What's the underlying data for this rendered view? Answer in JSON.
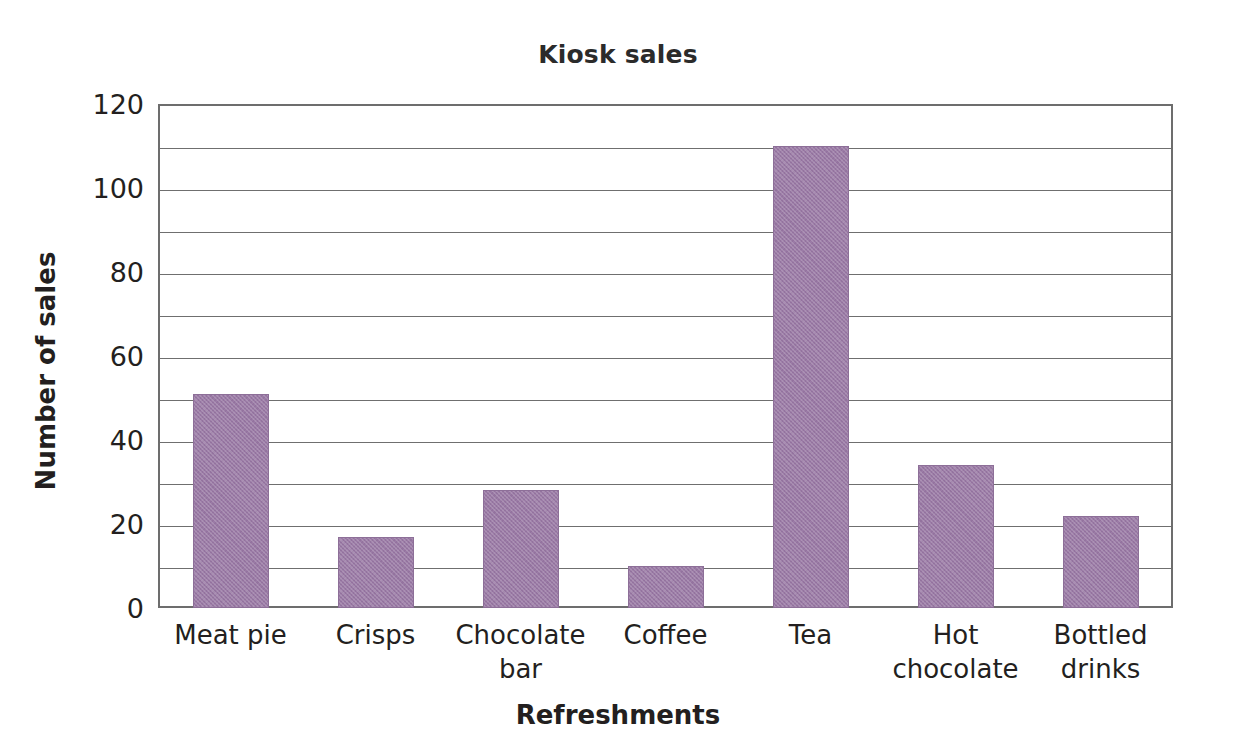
{
  "chart_data": {
    "type": "bar",
    "title": "Kiosk sales",
    "xlabel": "Refreshments",
    "ylabel": "Number of sales",
    "categories": [
      "Meat pie",
      "Crisps",
      "Chocolate bar",
      "Coffee",
      "Tea",
      "Hot chocolate",
      "Bottled drinks"
    ],
    "category_lines": [
      [
        "Meat pie"
      ],
      [
        "Crisps"
      ],
      [
        "Chocolate",
        "bar"
      ],
      [
        "Coffee"
      ],
      [
        "Tea"
      ],
      [
        "Hot",
        "chocolate"
      ],
      [
        "Bottled",
        "drinks"
      ]
    ],
    "values": [
      51,
      17,
      28,
      10,
      110,
      34,
      22
    ],
    "ylim": [
      0,
      120
    ],
    "ytick_labels": [
      "0",
      "20",
      "40",
      "60",
      "80",
      "100",
      "120"
    ],
    "ytick_values": [
      0,
      20,
      40,
      60,
      80,
      100,
      120
    ],
    "gridline_values": [
      10,
      20,
      30,
      40,
      50,
      60,
      70,
      80,
      90,
      100,
      110,
      120
    ],
    "grid": true,
    "legend": "none",
    "bar_color": "#9b7ba6",
    "grid_color": "#6f6f6f",
    "frame_color": "#6d6d6d",
    "text_color": "#231f20"
  }
}
